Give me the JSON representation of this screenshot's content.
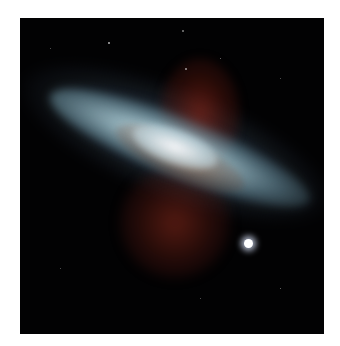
{
  "image": {
    "subject": "starburst galaxy",
    "background": "#ffffff",
    "frame_color": "#020203",
    "colors": {
      "disk": "#b4d2dc",
      "core": "#f0f6fa",
      "nebula_red": "#962819",
      "dust_brown": "#96502a"
    }
  }
}
